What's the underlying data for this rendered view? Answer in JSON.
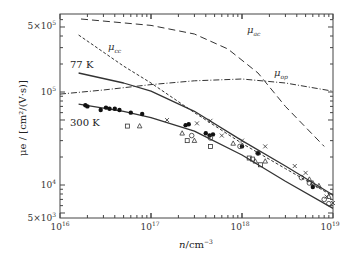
{
  "chart_data": {
    "type": "scatter",
    "title": "",
    "xlabel": "n/cm^-3",
    "ylabel": "μ_e/[cm^2/(V·s)]",
    "xscale": "log",
    "yscale": "log",
    "xlim": [
      1e+16,
      1e+19
    ],
    "ylim": [
      5000.0,
      650000.0
    ],
    "x_ticks": [
      "10^16",
      "10^17",
      "10^18",
      "10^19"
    ],
    "y_ticks": [
      "5×10^3",
      "10^4",
      "10^5",
      "5×10^5"
    ],
    "grid": false,
    "legend": "inline labels",
    "series": [
      {
        "name": "μ_ac",
        "style": "long-dash",
        "x": [
          1.7e+16,
          1e+17,
          3e+17,
          7e+17,
          1.5e+18,
          3e+18,
          8e+18
        ],
        "y": [
          610000.0,
          520000.0,
          420000.0,
          290000.0,
          160000.0,
          70000.0,
          26000.0
        ]
      },
      {
        "name": "μ_cc",
        "style": "short-dash",
        "x": [
          1.6e+16,
          5e+16,
          1e+17,
          3e+17,
          1e+18,
          3e+18,
          1e+19
        ],
        "y": [
          410000.0,
          190000.0,
          125000.0,
          60000.0,
          28000.0,
          15000.0,
          7600.0
        ]
      },
      {
        "name": "μ_op",
        "style": "dash-dot",
        "x": [
          1e+16,
          3e+16,
          1e+17,
          3e+17,
          1e+18,
          3e+18,
          1e+19
        ],
        "y": [
          95000.0,
          105000.0,
          120000.0,
          132000.0,
          138000.0,
          125000.0,
          102000.0
        ]
      },
      {
        "name": "77 K",
        "style": "solid",
        "x": [
          1.6e+16,
          5e+16,
          1e+17,
          3e+17,
          1e+18,
          3e+18,
          1e+19
        ],
        "y": [
          160000.0,
          125000.0,
          102000.0,
          62000.0,
          30000.0,
          16000.0,
          7800.0
        ]
      },
      {
        "name": "300 K",
        "style": "solid",
        "x": [
          1.6e+16,
          5e+16,
          1e+17,
          3e+17,
          1e+18,
          3e+18,
          1e+19
        ],
        "y": [
          74000.0,
          62000.0,
          53000.0,
          38000.0,
          21000.0,
          11000.0,
          5600.0
        ]
      },
      {
        "name": "data-filled-circles",
        "marker": "filled-circle",
        "x": [
          1.9e+16,
          2e+16,
          2.8e+16,
          3.2e+16,
          3.5e+16,
          4e+16,
          4.5e+16,
          6e+16,
          8e+16,
          2.4e+17,
          2.6e+17,
          4e+17,
          4.4e+17,
          4.8e+17,
          1e+18,
          1.5e+18,
          6e+18
        ],
        "y": [
          72000.0,
          70000.0,
          64000.0,
          68000.0,
          66000.0,
          66000.0,
          64000.0,
          60000.0,
          58000.0,
          44000.0,
          45000.0,
          36000.0,
          34000.0,
          35000.0,
          26000.0,
          22000.0,
          9500.0
        ]
      },
      {
        "name": "data-crosses",
        "marker": "x",
        "x": [
          1.5e+17,
          3.2e+17,
          4.5e+17,
          6e+17,
          1e+18,
          1.8e+18,
          3.8e+18,
          5e+18,
          8.5e+18,
          1e+19
        ],
        "y": [
          50000.0,
          46000.0,
          49000.0,
          34000.0,
          30000.0,
          26000.0,
          16000.0,
          13500.0,
          7500.0,
          6400.0
        ]
      },
      {
        "name": "data-triangles",
        "marker": "open-triangle",
        "x": [
          7.5e+16,
          2.2e+17,
          3e+17,
          8e+17,
          1.4e+18,
          1.8e+18,
          5.5e+18,
          6e+18,
          7e+18,
          9e+18
        ],
        "y": [
          43000.0,
          36000.0,
          30000.0,
          28000.0,
          18000.0,
          18000.0,
          11500.0,
          10500.0,
          9800.0,
          7500.0
        ]
      },
      {
        "name": "data-open-circles",
        "marker": "open-circle",
        "x": [
          2.8e+17,
          4.5e+17,
          9.5e+17,
          1.5e+18,
          4.5e+18,
          5.5e+18,
          8e+18,
          9e+18
        ],
        "y": [
          34000.0,
          32000.0,
          26000.0,
          22000.0,
          12000.0,
          10500.0,
          7000.0,
          6300.0
        ]
      },
      {
        "name": "data-squares",
        "marker": "open-square",
        "x": [
          5.5e+16,
          2.5e+17,
          4.5e+17,
          1.2e+18,
          1.3e+18,
          1.6e+18
        ],
        "y": [
          43000.0,
          30000.0,
          26000.0,
          19500.0,
          19000.0,
          16500.0
        ]
      }
    ],
    "annotations": [
      "μ_ac",
      "μ_cc",
      "μ_op",
      "77 K",
      "300 K"
    ]
  },
  "axes": {
    "x_title_main": "n",
    "x_title_unit": "/cm",
    "x_title_exp": "−3",
    "y_title": "μe / [cm²/(V·s)]",
    "x_tick_labels": [
      {
        "base": "10",
        "exp": "16"
      },
      {
        "base": "10",
        "exp": "17"
      },
      {
        "base": "10",
        "exp": "18"
      },
      {
        "base": "10",
        "exp": "19"
      }
    ],
    "y_tick_labels": [
      {
        "base": "5×10",
        "exp": "5"
      },
      {
        "base": "10",
        "exp": "5"
      },
      {
        "base": "10",
        "exp": "4"
      },
      {
        "base": "5×10",
        "exp": "3"
      }
    ]
  },
  "labels": {
    "mu_ac": "μ",
    "mu_ac_sub": "ac",
    "mu_cc": "μ",
    "mu_cc_sub": "cc",
    "mu_op": "μ",
    "mu_op_sub": "op",
    "t77": "77 K",
    "t300": "300 K"
  },
  "colors": {
    "ink": "#222222",
    "axis": "#444444",
    "curves": "#333333"
  }
}
